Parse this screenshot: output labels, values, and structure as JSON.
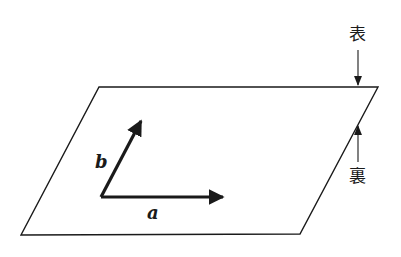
{
  "diagram": {
    "plane": {
      "shape": "parallelogram",
      "corners": [
        [
          99,
          87
        ],
        [
          378,
          87
        ],
        [
          300,
          234
        ],
        [
          21,
          235
        ]
      ],
      "stroke": "#1a1a1a"
    },
    "vectors": [
      {
        "name": "a",
        "label": "a",
        "from": [
          101,
          197
        ],
        "to": [
          223,
          197
        ]
      },
      {
        "name": "b",
        "label": "b",
        "from": [
          101,
          197
        ],
        "to": [
          141,
          120
        ]
      }
    ],
    "side_labels": {
      "front": {
        "label": "表",
        "arrow_direction": "down"
      },
      "back": {
        "label": "裏",
        "arrow_direction": "up"
      }
    },
    "colors": {
      "ink": "#1a1a1a",
      "background": "#ffffff"
    }
  }
}
